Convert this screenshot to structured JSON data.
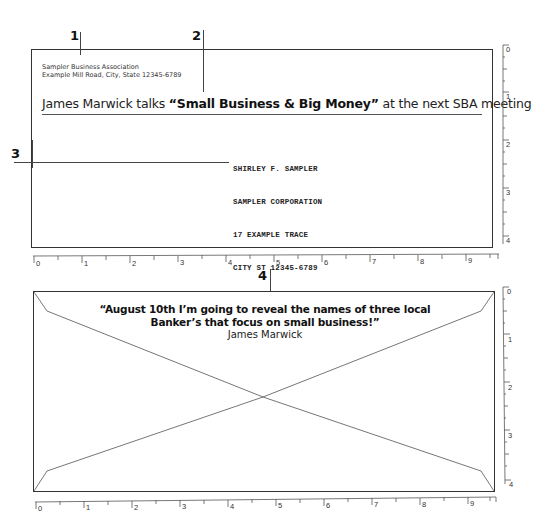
{
  "callouts": [
    {
      "number": "1",
      "x": 78,
      "y": 33
    },
    {
      "number": "2",
      "x": 192,
      "y": 33
    },
    {
      "number": "3",
      "x": 11,
      "y": 148
    },
    {
      "number": "4",
      "x": 258,
      "y": 270
    }
  ],
  "envelope_front": {
    "return_address": {
      "line1": "Sampler Business Association",
      "line2": "Example Mill Road, City, State 12345-6789"
    },
    "headline": {
      "prefix": "James Marwick talks ",
      "bold": "“Small Business & Big Money”",
      "suffix": " at the next SBA meeting"
    },
    "recipient": {
      "line1": "SHIRLEY F. SAMPLER",
      "line2": "SAMPLER CORPORATION",
      "line3": "17 EXAMPLE TRACE",
      "line4": "CITY ST 12345-6789"
    }
  },
  "envelope_back": {
    "quote_line1": "“August 10th I’m going to reveal the names of three local",
    "quote_line2": "Banker’s that focus on small business!”",
    "author": "James Marwick"
  },
  "rulers": {
    "horizontal_labels": [
      "0",
      "1",
      "2",
      "3",
      "4",
      "5",
      "6",
      "7",
      "8",
      "9"
    ],
    "vertical_labels": [
      "0",
      "1",
      "2",
      "3",
      "4"
    ]
  },
  "colors": {
    "ink": "#222222",
    "border": "#333333",
    "ruler": "#555555",
    "background": "#ffffff"
  }
}
